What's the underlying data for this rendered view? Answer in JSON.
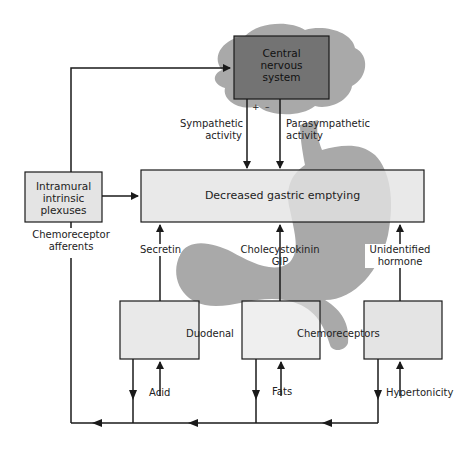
{
  "diagram": {
    "nodes": {
      "cns": {
        "line1": "Central",
        "line2": "nervous",
        "line3": "system"
      },
      "intramural": {
        "line1": "Intramural",
        "line2": "intrinsic",
        "line3": "plexuses"
      },
      "main": {
        "label": "Decreased gastric emptying"
      },
      "duodenal": {
        "label": "Duodenal"
      },
      "chemoreceptors": {
        "label": "Chemoreceptors"
      }
    },
    "edges": {
      "sympathetic": {
        "line1": "Sympathetic",
        "line2": "activity"
      },
      "parasympathetic": {
        "line1": "Parasympathetic",
        "line2": "activity"
      },
      "plus_sign": "+",
      "minus_sign": "–",
      "chemoreceptor_afferents": {
        "line1": "Chemoreceptor",
        "line2": "afferents"
      },
      "secretin": "Secretin",
      "cck": {
        "line1": "Cholecystokinin",
        "line2": "GIP"
      },
      "unidentified": {
        "line1": "Unidentified",
        "line2": "hormone"
      },
      "acid": "Acid",
      "fats": "Fats",
      "hypertonicity": "Hypertonicity"
    },
    "colors": {
      "box_fill": "#e4e4e4",
      "cns_fill": "#6a6a6a",
      "silhouette": "#a9a9a9",
      "overlap": "#6e6e6e",
      "line": "#1a1a1a"
    }
  }
}
